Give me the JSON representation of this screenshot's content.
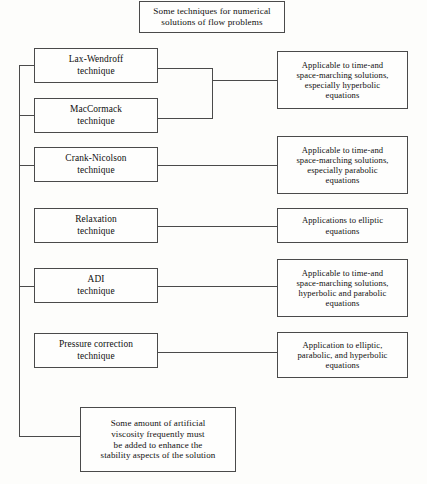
{
  "diagram": {
    "title_box": {
      "text": "Some techniques for numerical\nsolutions of flow problems"
    },
    "techniques": [
      {
        "id": "lax-wendroff",
        "text": "Lax-Wendroff\ntechnique"
      },
      {
        "id": "maccormack",
        "text": "MacCormack\ntechnique"
      },
      {
        "id": "crank-nicolson",
        "text": "Crank-Nicolson\ntechnique"
      },
      {
        "id": "relaxation",
        "text": "Relaxation\ntechnique"
      },
      {
        "id": "adi",
        "text": "ADI\ntechnique"
      },
      {
        "id": "pressure-correction",
        "text": "Pressure correction\ntechnique"
      }
    ],
    "descriptions": [
      {
        "id": "desc-hyperbolic",
        "text": "Applicable to time-and\nspace-marching solutions,\nespecially hyperbolic\nequations"
      },
      {
        "id": "desc-parabolic",
        "text": "Applicable to time-and\nspace-marching solutions,\nespecially parabolic\nequations"
      },
      {
        "id": "desc-elliptic",
        "text": "Applications to elliptic\nequations"
      },
      {
        "id": "desc-hyperbolic-parabolic",
        "text": "Applicable to time-and\nspace-marching solutions,\nhyperbolic and parabolic\nequations"
      },
      {
        "id": "desc-elliptic-parabolic-hyp",
        "text": "Application to elliptic,\nparabolic, and hyperbolic\nequations"
      }
    ],
    "note_box": {
      "text": "Some amount of artificial\nviscosity frequently must\nbe added to enhance the\nstability aspects of the solution"
    },
    "colors": {
      "background": "#fdfdfb",
      "box_fill": "#fefefd",
      "border": "#4a4a4a",
      "text": "#10100f",
      "connector": "#4a4a4a"
    }
  }
}
